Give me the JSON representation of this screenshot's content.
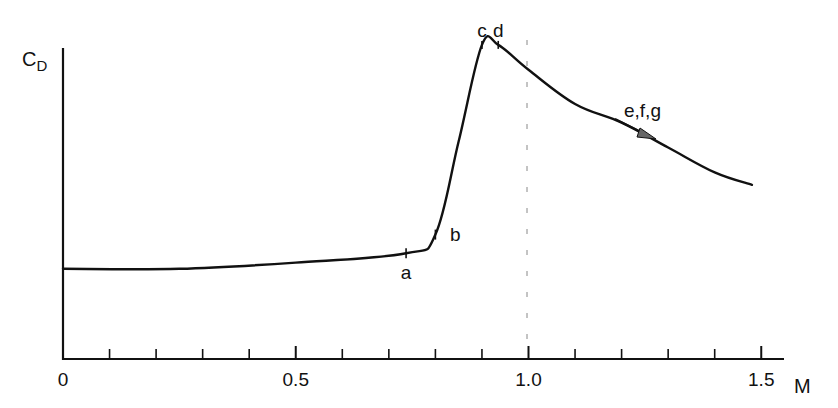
{
  "chart_data": {
    "type": "line",
    "title": "",
    "xlabel": "M",
    "ylabel": "C_D",
    "ylabel_main": "C",
    "ylabel_sub": "D",
    "xlim": [
      0,
      1.55
    ],
    "ylim": [
      0,
      1.0
    ],
    "x_ticks": [
      0,
      0.1,
      0.2,
      0.3,
      0.4,
      0.5,
      0.6,
      0.7,
      0.8,
      0.9,
      1.0,
      1.1,
      1.2,
      1.3,
      1.4,
      1.5
    ],
    "x_tick_labels": [
      {
        "value": 0,
        "label": "0"
      },
      {
        "value": 0.5,
        "label": "0.5"
      },
      {
        "value": 1.0,
        "label": "1.0"
      },
      {
        "value": 1.5,
        "label": "1.5"
      }
    ],
    "y_ticks": [],
    "grid": false,
    "legend": null,
    "series": [
      {
        "name": "Drag coefficient vs Mach number",
        "x": [
          0,
          0.25,
          0.5,
          0.737,
          0.8,
          0.85,
          0.9,
          0.935,
          1.0,
          1.1,
          1.2,
          1.3,
          1.4,
          1.48
        ],
        "y": [
          0.29,
          0.29,
          0.31,
          0.34,
          0.4,
          0.7,
          1.01,
          1.01,
          0.93,
          0.82,
          0.76,
          0.68,
          0.6,
          0.56
        ]
      }
    ],
    "reference_lines": [
      {
        "type": "vertical",
        "x": 1.0,
        "style": "dashed",
        "color": "#888888"
      }
    ],
    "annotations": [
      {
        "label": "a",
        "x": 0.737,
        "y": 0.34,
        "position": "below"
      },
      {
        "label": "b",
        "x": 0.8,
        "y": 0.4,
        "position": "right"
      },
      {
        "label": "c",
        "x": 0.9,
        "y": 1.01,
        "position": "above"
      },
      {
        "label": "d",
        "x": 0.935,
        "y": 1.01,
        "position": "above"
      },
      {
        "label": "e,f,g",
        "x": 1.22,
        "y": 0.78,
        "position": "above",
        "arrow": "pointing down-right along curve"
      }
    ],
    "units_note": "y values are relative (normalized to top of y-axis); no y tick labels shown"
  },
  "colors": {
    "curve": "#111111",
    "axis": "#111111",
    "reference_line": "#888888",
    "arrow_fill": "#555555"
  }
}
